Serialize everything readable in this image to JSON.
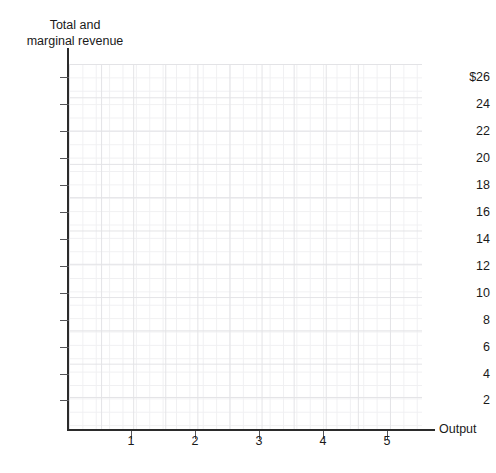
{
  "chart_data": {
    "type": "line",
    "title": "",
    "subtitle": "",
    "ylabel_line1": "Total and",
    "ylabel_line2": "marginal revenue",
    "xlabel": "Output",
    "xlim": [
      0,
      5.5
    ],
    "ylim": [
      0,
      27
    ],
    "grid": true,
    "grid_minor": true,
    "legend": "none",
    "series": [],
    "annotations": [],
    "y_ticks": [
      {
        "value": 26,
        "label": "$26"
      },
      {
        "value": 24,
        "label": "24"
      },
      {
        "value": 22,
        "label": "22"
      },
      {
        "value": 20,
        "label": "20"
      },
      {
        "value": 18,
        "label": "18"
      },
      {
        "value": 16,
        "label": "16"
      },
      {
        "value": 14,
        "label": "14"
      },
      {
        "value": 12,
        "label": "12"
      },
      {
        "value": 10,
        "label": "10"
      },
      {
        "value": 8,
        "label": "8"
      },
      {
        "value": 6,
        "label": "6"
      },
      {
        "value": 4,
        "label": "4"
      },
      {
        "value": 2,
        "label": "2"
      }
    ],
    "x_ticks": [
      {
        "value": 1,
        "label": "1"
      },
      {
        "value": 2,
        "label": "2"
      },
      {
        "value": 3,
        "label": "3"
      },
      {
        "value": 4,
        "label": "4"
      },
      {
        "value": 5,
        "label": "5"
      }
    ],
    "colors": {
      "background": "#ffffff",
      "axis": "#2b2b2b",
      "grid_major": "#e3e3e6",
      "grid_minor": "#f0f0f2",
      "text": "#1a1a1a"
    }
  },
  "layout": {
    "y_tick_pixel_positions": [
      77,
      104,
      131,
      158,
      185,
      212,
      239,
      266,
      293,
      320,
      347,
      374,
      400
    ],
    "x_tick_pixel_positions": [
      131,
      195,
      259,
      323,
      387
    ]
  }
}
